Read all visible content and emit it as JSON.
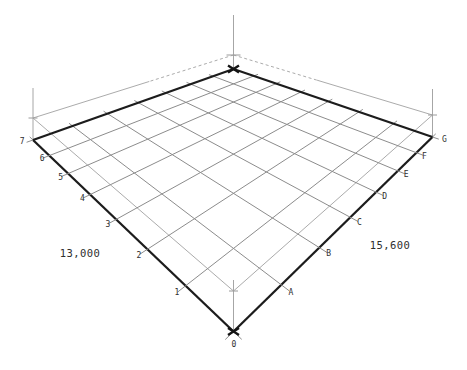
{
  "drawing": {
    "title": "structural-grid-plan-perspective",
    "axes": {
      "row_labels": [
        "1",
        "2",
        "3",
        "4",
        "5",
        "6",
        "7"
      ],
      "col_labels": [
        "A",
        "B",
        "C",
        "D",
        "E",
        "F",
        "G"
      ],
      "origin_label": "0",
      "dim_left": "13,000",
      "dim_right": "15,600"
    },
    "colors": {
      "edge": "#1c1c1c",
      "grid": "#8c8c8c",
      "upper": "#ababab",
      "vertical": "#a6a6a6",
      "marker": "#141414",
      "cross": "#9a9a9a",
      "label": "#2f2f2f"
    },
    "geometry": {
      "canvas": [
        467,
        370
      ],
      "divisions": 7,
      "base_corners": {
        "F": [
          233.5,
          331.5
        ],
        "R": [
          432.5,
          137
        ],
        "L": [
          33,
          140
        ],
        "B": [
          233.5,
          69
        ]
      },
      "upper_corners": {
        "F": [
          233.5,
          291
        ],
        "R": [
          432.5,
          115
        ],
        "L": [
          33,
          118
        ],
        "B": [
          233.5,
          55
        ]
      },
      "verticals": {
        "B": [
          233.5,
          15,
          69
        ],
        "L": [
          33,
          88,
          140
        ],
        "R": [
          432.5,
          89,
          137
        ],
        "F": [
          233.5,
          280,
          331.5
        ]
      },
      "overshoot_front": 0.15,
      "overshoot_back": 0.22,
      "dash_fraction": 0.42,
      "row_label_offset": [
        -0.16,
        0
      ],
      "row_last_label_pos": [
        -0.2,
        7.15
      ],
      "col_label_offset": [
        0,
        -0.18
      ],
      "col_last_label_pos": [
        7.1,
        -0.25
      ],
      "label_font_size": 8
    }
  }
}
